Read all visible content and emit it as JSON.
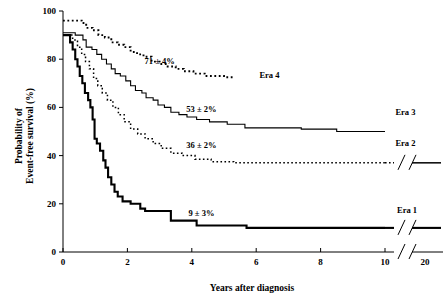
{
  "chart_data": {
    "type": "line",
    "title": "",
    "xlabel": "Years after diagnosis",
    "ylabel_line1": "Probability of",
    "ylabel_line2": "Event-free survival (%)",
    "xlim": [
      0,
      20
    ],
    "ylim": [
      0,
      100
    ],
    "grid": false,
    "legend_position": "inline-right",
    "x_ticks": [
      "0",
      "2",
      "4",
      "6",
      "8",
      "10",
      "20"
    ],
    "x_tick_values": [
      0,
      2,
      4,
      6,
      8,
      10,
      20
    ],
    "y_ticks": [
      "0",
      "20",
      "40",
      "60",
      "80",
      "100"
    ],
    "y_tick_values": [
      0,
      20,
      40,
      60,
      80,
      100
    ],
    "axis_break": {
      "present": true,
      "after_value": 10,
      "glyph": "//"
    },
    "series": [
      {
        "name": "Era 1",
        "label": "Era 1",
        "annotation": "9 ± 3%",
        "annotation_x": 4.3,
        "annotation_y": 15,
        "label_x": 13.0,
        "label_y": 16,
        "style": "solid-thick",
        "stroke_width": 2.1,
        "dash": "none",
        "extends_to_break": true,
        "final_value": 9,
        "points": [
          [
            0.0,
            90
          ],
          [
            0.22,
            90
          ],
          [
            0.22,
            87
          ],
          [
            0.3,
            87
          ],
          [
            0.3,
            84
          ],
          [
            0.38,
            84
          ],
          [
            0.38,
            80
          ],
          [
            0.45,
            80
          ],
          [
            0.45,
            77
          ],
          [
            0.52,
            77
          ],
          [
            0.52,
            73
          ],
          [
            0.6,
            73
          ],
          [
            0.6,
            70
          ],
          [
            0.68,
            70
          ],
          [
            0.68,
            66
          ],
          [
            0.78,
            66
          ],
          [
            0.78,
            63
          ],
          [
            0.85,
            63
          ],
          [
            0.85,
            60
          ],
          [
            0.92,
            60
          ],
          [
            0.92,
            55
          ],
          [
            0.98,
            55
          ],
          [
            0.98,
            47
          ],
          [
            1.05,
            47
          ],
          [
            1.05,
            45
          ],
          [
            1.15,
            45
          ],
          [
            1.15,
            42
          ],
          [
            1.25,
            42
          ],
          [
            1.25,
            38
          ],
          [
            1.32,
            38
          ],
          [
            1.32,
            35
          ],
          [
            1.4,
            35
          ],
          [
            1.4,
            31
          ],
          [
            1.5,
            31
          ],
          [
            1.5,
            28
          ],
          [
            1.6,
            28
          ],
          [
            1.6,
            25
          ],
          [
            1.7,
            25
          ],
          [
            1.7,
            23
          ],
          [
            1.85,
            23
          ],
          [
            1.85,
            21
          ],
          [
            2.1,
            21
          ],
          [
            2.1,
            20
          ],
          [
            2.4,
            20
          ],
          [
            2.4,
            18
          ],
          [
            2.55,
            18
          ],
          [
            2.55,
            17
          ],
          [
            3.35,
            17
          ],
          [
            3.35,
            13
          ],
          [
            4.15,
            13
          ],
          [
            4.15,
            11
          ],
          [
            5.7,
            11
          ],
          [
            5.7,
            10
          ],
          [
            10.0,
            10
          ]
        ]
      },
      {
        "name": "Era 2",
        "label": "Era 2",
        "annotation": "36 ± 2%",
        "annotation_x": 4.3,
        "annotation_y": 43,
        "label_x": 12.6,
        "label_y": 44,
        "style": "dotted",
        "stroke_width": 1.5,
        "dash": "1.6 2.4",
        "extends_to_break": true,
        "final_value": 36,
        "points": [
          [
            0.0,
            90
          ],
          [
            0.3,
            90
          ],
          [
            0.3,
            88
          ],
          [
            0.45,
            88
          ],
          [
            0.45,
            85
          ],
          [
            0.58,
            85
          ],
          [
            0.58,
            82
          ],
          [
            0.7,
            82
          ],
          [
            0.7,
            79
          ],
          [
            0.82,
            79
          ],
          [
            0.82,
            76
          ],
          [
            0.95,
            76
          ],
          [
            0.95,
            72
          ],
          [
            1.08,
            72
          ],
          [
            1.08,
            69
          ],
          [
            1.22,
            69
          ],
          [
            1.22,
            66
          ],
          [
            1.38,
            66
          ],
          [
            1.38,
            63
          ],
          [
            1.55,
            63
          ],
          [
            1.55,
            60
          ],
          [
            1.72,
            60
          ],
          [
            1.72,
            57
          ],
          [
            1.9,
            57
          ],
          [
            1.9,
            54
          ],
          [
            2.1,
            54
          ],
          [
            2.1,
            51
          ],
          [
            2.32,
            51
          ],
          [
            2.32,
            49
          ],
          [
            2.55,
            49
          ],
          [
            2.55,
            47
          ],
          [
            2.8,
            47
          ],
          [
            2.8,
            45
          ],
          [
            3.05,
            45
          ],
          [
            3.05,
            43
          ],
          [
            3.35,
            43
          ],
          [
            3.35,
            41
          ],
          [
            3.7,
            41
          ],
          [
            3.7,
            40
          ],
          [
            4.1,
            40
          ],
          [
            4.1,
            38.5
          ],
          [
            4.6,
            38.5
          ],
          [
            4.6,
            37.5
          ],
          [
            5.3,
            37.5
          ],
          [
            5.3,
            37
          ],
          [
            10.0,
            37
          ]
        ]
      },
      {
        "name": "Era 3",
        "label": "Era 3",
        "annotation": "53 ± 2%",
        "annotation_x": 4.3,
        "annotation_y": 58,
        "label_x": 12.6,
        "label_y": 57,
        "style": "solid-thin",
        "stroke_width": 1.1,
        "dash": "none",
        "extends_to_break": false,
        "final_value": 53,
        "points": [
          [
            0.0,
            91
          ],
          [
            0.38,
            91
          ],
          [
            0.38,
            90
          ],
          [
            0.62,
            90
          ],
          [
            0.62,
            88
          ],
          [
            0.72,
            88
          ],
          [
            0.72,
            85
          ],
          [
            0.9,
            85
          ],
          [
            0.9,
            84
          ],
          [
            1.05,
            84
          ],
          [
            1.05,
            82
          ],
          [
            1.2,
            82
          ],
          [
            1.2,
            80
          ],
          [
            1.35,
            80
          ],
          [
            1.35,
            78
          ],
          [
            1.5,
            78
          ],
          [
            1.5,
            76
          ],
          [
            1.62,
            76
          ],
          [
            1.62,
            74
          ],
          [
            1.78,
            74
          ],
          [
            1.78,
            73
          ],
          [
            1.95,
            73
          ],
          [
            1.95,
            71
          ],
          [
            2.1,
            71
          ],
          [
            2.1,
            69
          ],
          [
            2.25,
            69
          ],
          [
            2.25,
            67
          ],
          [
            2.45,
            67
          ],
          [
            2.45,
            66
          ],
          [
            2.58,
            66
          ],
          [
            2.58,
            64
          ],
          [
            2.8,
            64
          ],
          [
            2.8,
            63
          ],
          [
            2.95,
            63
          ],
          [
            2.95,
            61
          ],
          [
            3.15,
            61
          ],
          [
            3.15,
            60
          ],
          [
            3.35,
            60
          ],
          [
            3.35,
            58
          ],
          [
            3.6,
            58
          ],
          [
            3.6,
            57
          ],
          [
            3.85,
            57
          ],
          [
            3.85,
            56
          ],
          [
            4.15,
            56
          ],
          [
            4.15,
            55
          ],
          [
            4.55,
            55
          ],
          [
            4.55,
            54
          ],
          [
            5.1,
            54
          ],
          [
            5.1,
            53
          ],
          [
            5.65,
            53
          ],
          [
            5.65,
            51.5
          ],
          [
            7.4,
            51.5
          ],
          [
            7.4,
            51
          ],
          [
            8.5,
            51
          ],
          [
            8.5,
            50
          ],
          [
            10.0,
            50
          ]
        ]
      },
      {
        "name": "Era 4",
        "label": "Era 4",
        "annotation": "71 ± 4%",
        "annotation_x": 3.0,
        "annotation_y": 78,
        "label_x": 6.1,
        "label_y": 72,
        "style": "dotted-bold",
        "stroke_width": 1.9,
        "dash": "1.8 2.6",
        "extends_to_break": false,
        "final_value": 71,
        "points": [
          [
            0.0,
            96
          ],
          [
            0.58,
            96
          ],
          [
            0.58,
            95
          ],
          [
            0.72,
            95
          ],
          [
            0.72,
            93
          ],
          [
            0.92,
            93
          ],
          [
            0.92,
            92
          ],
          [
            1.1,
            92
          ],
          [
            1.1,
            90
          ],
          [
            1.3,
            90
          ],
          [
            1.3,
            89
          ],
          [
            1.5,
            89
          ],
          [
            1.5,
            87
          ],
          [
            1.7,
            87
          ],
          [
            1.7,
            86
          ],
          [
            1.9,
            86
          ],
          [
            1.9,
            85
          ],
          [
            2.1,
            85
          ],
          [
            2.1,
            83
          ],
          [
            2.3,
            83
          ],
          [
            2.3,
            82
          ],
          [
            2.5,
            82
          ],
          [
            2.5,
            81
          ],
          [
            2.75,
            81
          ],
          [
            2.75,
            79
          ],
          [
            3.0,
            79
          ],
          [
            3.0,
            78
          ],
          [
            3.25,
            78
          ],
          [
            3.25,
            77
          ],
          [
            3.5,
            77
          ],
          [
            3.5,
            76
          ],
          [
            3.75,
            76
          ],
          [
            3.75,
            75
          ],
          [
            4.05,
            75
          ],
          [
            4.05,
            74
          ],
          [
            4.4,
            74
          ],
          [
            4.4,
            73
          ],
          [
            5.0,
            73
          ],
          [
            5.0,
            72.5
          ],
          [
            5.3,
            72.5
          ]
        ]
      }
    ]
  }
}
